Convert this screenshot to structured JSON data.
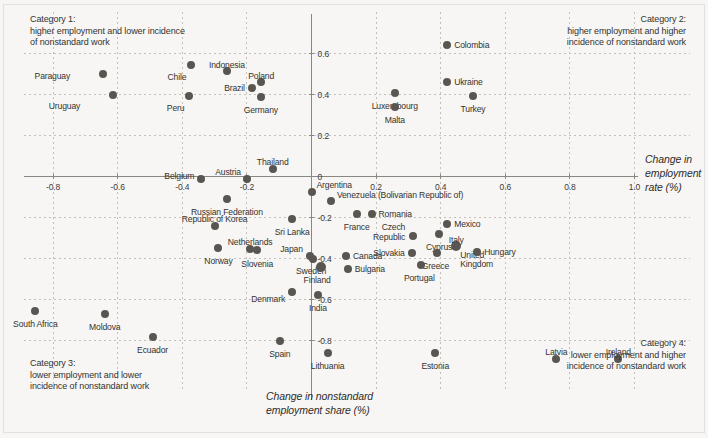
{
  "chart_data": {
    "type": "scatter",
    "title": "",
    "xlabel": "Change in nonstandard employment share (%)",
    "ylabel": "Change in employment rate (%)",
    "xlim": [
      -0.95,
      1.06
    ],
    "ylim": [
      -0.95,
      0.72
    ],
    "xticks": [
      -0.8,
      -0.6,
      -0.4,
      -0.2,
      0,
      0.2,
      0.4,
      0.6,
      0.8,
      1.0
    ],
    "xticklabels": [
      "-0.8",
      "-0.6",
      "-0.4",
      "-0.2",
      "",
      "0.2",
      "0.4",
      "0.6",
      "0.8",
      "1.0"
    ],
    "yticks": [
      0.6,
      0.4,
      0.2,
      0,
      -0.2,
      -0.4,
      -0.6,
      -0.8
    ],
    "yticklabels": [
      "0.6",
      "0.4",
      "0.2",
      "0",
      "-0.2",
      "-0.4",
      "-0.6",
      "-0.8"
    ],
    "grid": true,
    "legend": "none",
    "point_color": "#595652",
    "axis_color": "#8a8780",
    "background": "#f7f6f4",
    "points": [
      {
        "label": "Paraguay",
        "x": -0.645,
        "y": 0.498,
        "lx": -33,
        "ly": 3,
        "anchor": "end"
      },
      {
        "label": "Uruguay",
        "x": -0.614,
        "y": 0.4,
        "lx": -33,
        "ly": 12,
        "anchor": "end"
      },
      {
        "label": "Chile",
        "x": -0.372,
        "y": 0.545,
        "lx": -5,
        "ly": 13,
        "anchor": "end"
      },
      {
        "label": "Peru",
        "x": -0.378,
        "y": 0.395,
        "lx": -5,
        "ly": 13,
        "anchor": "end"
      },
      {
        "label": "Indonesia",
        "x": -0.262,
        "y": 0.517,
        "lx": 0,
        "ly": -5,
        "anchor": "middle"
      },
      {
        "label": "Brazil",
        "x": -0.185,
        "y": 0.433,
        "lx": -7,
        "ly": 1,
        "anchor": "end"
      },
      {
        "label": "Poland",
        "x": -0.156,
        "y": 0.462,
        "lx": 0,
        "ly": -5,
        "anchor": "middle"
      },
      {
        "label": "Germany",
        "x": -0.157,
        "y": 0.39,
        "lx": 0,
        "ly": 14,
        "anchor": "middle"
      },
      {
        "label": "Colombia",
        "x": 0.42,
        "y": 0.64,
        "lx": 7,
        "ly": 1,
        "anchor": "start"
      },
      {
        "label": "Ukraine",
        "x": 0.42,
        "y": 0.461,
        "lx": 7,
        "ly": 1,
        "anchor": "start"
      },
      {
        "label": "Luxembourg",
        "x": 0.258,
        "y": 0.408,
        "lx": 0,
        "ly": 14,
        "anchor": "middle"
      },
      {
        "label": "Malta",
        "x": 0.258,
        "y": 0.34,
        "lx": 0,
        "ly": 14,
        "anchor": "middle"
      },
      {
        "label": "Turkey",
        "x": 0.5,
        "y": 0.393,
        "lx": 0,
        "ly": 14,
        "anchor": "middle"
      },
      {
        "label": "Belgium",
        "x": -0.341,
        "y": -0.012,
        "lx": -7,
        "ly": -2,
        "anchor": "end"
      },
      {
        "label": "Austria",
        "x": -0.2,
        "y": -0.01,
        "lx": -6,
        "ly": -6,
        "anchor": "end"
      },
      {
        "label": "Thailand",
        "x": -0.12,
        "y": 0.035,
        "lx": 0,
        "ly": -6,
        "anchor": "middle"
      },
      {
        "label": "Argentina",
        "x": 0.0,
        "y": -0.075,
        "lx": 5,
        "ly": -6,
        "anchor": "start"
      },
      {
        "label": "Venezuela (Bolivarian Republic of)",
        "x": 0.06,
        "y": -0.118,
        "lx": 6,
        "ly": -5,
        "anchor": "start"
      },
      {
        "label": "Russian Federation",
        "x": -0.262,
        "y": -0.108,
        "lx": 0,
        "ly": 14,
        "anchor": "middle"
      },
      {
        "label": "Sri Lanka",
        "x": -0.06,
        "y": -0.205,
        "lx": 0,
        "ly": 14,
        "anchor": "middle"
      },
      {
        "label": "France",
        "x": 0.14,
        "y": -0.183,
        "lx": 0,
        "ly": 14,
        "anchor": "middle"
      },
      {
        "label": "Romania",
        "x": 0.186,
        "y": -0.183,
        "lx": 7,
        "ly": 1,
        "anchor": "start"
      },
      {
        "label": "Republic of Korea",
        "x": -0.3,
        "y": -0.243,
        "lx": 0,
        "ly": -6,
        "anchor": "middle"
      },
      {
        "label": "Mexico",
        "x": 0.42,
        "y": -0.23,
        "lx": 7,
        "ly": 1,
        "anchor": "start"
      },
      {
        "label": "Czech Republic",
        "x": 0.315,
        "y": -0.292,
        "lx": -8,
        "ly": -8,
        "anchor": "end",
        "two": true
      },
      {
        "label": "Cyprus",
        "x": 0.395,
        "y": -0.281,
        "lx": 0,
        "ly": 14,
        "anchor": "middle"
      },
      {
        "label": "Japan",
        "x": -0.005,
        "y": -0.39,
        "lx": -7,
        "ly": -6,
        "anchor": "end"
      },
      {
        "label": "Norway",
        "x": -0.288,
        "y": -0.347,
        "lx": 0,
        "ly": 14,
        "anchor": "middle"
      },
      {
        "label": "Netherlands",
        "x": -0.19,
        "y": -0.352,
        "lx": 0,
        "ly": -6,
        "anchor": "middle"
      },
      {
        "label": "Slovenia",
        "x": -0.168,
        "y": -0.36,
        "lx": 0,
        "ly": 15,
        "anchor": "middle"
      },
      {
        "label": "Sweden",
        "x": 0.005,
        "y": -0.4,
        "lx": -2,
        "ly": 13,
        "anchor": "middle"
      },
      {
        "label": "Canada",
        "x": 0.107,
        "y": -0.39,
        "lx": 7,
        "ly": 1,
        "anchor": "start"
      },
      {
        "label": "Finland",
        "x": 0.03,
        "y": -0.44,
        "lx": -4,
        "ly": 14,
        "anchor": "middle",
        "big": true
      },
      {
        "label": "Bulgaria",
        "x": 0.112,
        "y": -0.45,
        "lx": 7,
        "ly": 1,
        "anchor": "start"
      },
      {
        "label": "Italy",
        "x": 0.448,
        "y": -0.337,
        "lx": 0,
        "ly": -5,
        "anchor": "middle",
        "big": true
      },
      {
        "label": "Slovakia",
        "x": 0.31,
        "y": -0.372,
        "lx": -7,
        "ly": 1,
        "anchor": "end"
      },
      {
        "label": "Greece",
        "x": 0.39,
        "y": -0.372,
        "lx": -2,
        "ly": 14,
        "anchor": "middle"
      },
      {
        "label": "United Kingdom",
        "x": 0.448,
        "y": -0.337,
        "lx": 4,
        "ly": 10,
        "anchor": "start",
        "two": true
      },
      {
        "label": "Hungary",
        "x": 0.513,
        "y": -0.37,
        "lx": 7,
        "ly": 1,
        "anchor": "start"
      },
      {
        "label": "Portugal",
        "x": 0.34,
        "y": -0.432,
        "lx": -2,
        "ly": 14,
        "anchor": "middle"
      },
      {
        "label": "Denmark",
        "x": -0.06,
        "y": -0.562,
        "lx": -7,
        "ly": 8,
        "anchor": "end"
      },
      {
        "label": "India",
        "x": 0.02,
        "y": -0.578,
        "lx": 0,
        "ly": 14,
        "anchor": "middle"
      },
      {
        "label": "South Africa",
        "x": -0.855,
        "y": -0.658,
        "lx": 0,
        "ly": 14,
        "anchor": "middle"
      },
      {
        "label": "Moldova",
        "x": -0.64,
        "y": -0.672,
        "lx": 0,
        "ly": 14,
        "anchor": "middle"
      },
      {
        "label": "Ecuador",
        "x": -0.492,
        "y": -0.783,
        "lx": 0,
        "ly": 14,
        "anchor": "middle"
      },
      {
        "label": "Spain",
        "x": -0.098,
        "y": -0.8,
        "lx": 0,
        "ly": 14,
        "anchor": "middle"
      },
      {
        "label": "Lithuania",
        "x": 0.05,
        "y": -0.86,
        "lx": 0,
        "ly": 14,
        "anchor": "middle"
      },
      {
        "label": "Estonia",
        "x": 0.383,
        "y": -0.862,
        "lx": 0,
        "ly": 14,
        "anchor": "middle"
      },
      {
        "label": "Latvia",
        "x": 0.758,
        "y": -0.89,
        "lx": 0,
        "ly": -6,
        "anchor": "middle"
      },
      {
        "label": "Ireland",
        "x": 0.95,
        "y": -0.89,
        "lx": 0,
        "ly": -6,
        "anchor": "middle"
      }
    ]
  },
  "quadrants": {
    "cat1": "Category 1:\nhigher employment and lower incidence\nof nonstandard work",
    "cat2": "Category 2:\nhigher employment and higher\nincidence of nonstandard work",
    "cat3": "Category 3:\nlower employment and lower\nincidence of nonstandard work",
    "cat4": "Category 4:\nlower employment and higher\nincidence of nonstandard work"
  },
  "axis_titles": {
    "x": "Change in nonstandard\nemployment share (%)",
    "y": "Change in\nemployment\nrate (%)"
  }
}
